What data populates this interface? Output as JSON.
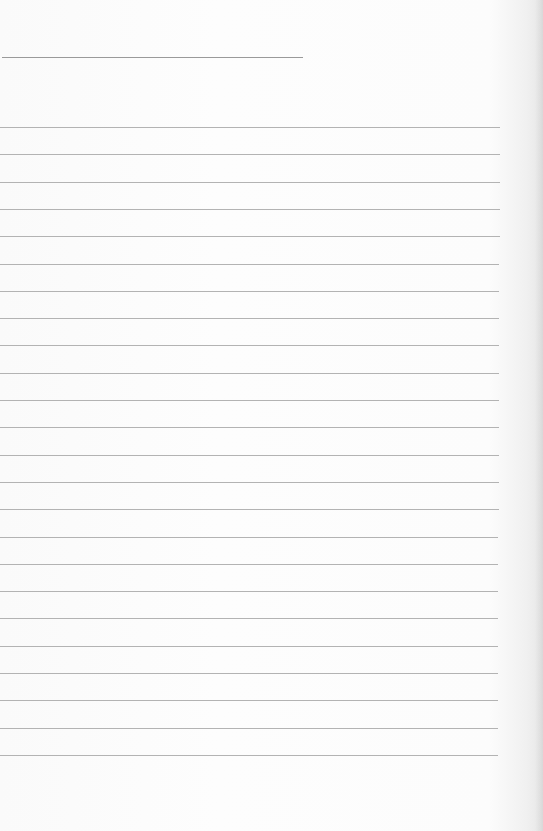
{
  "page": {
    "type": "lined-paper",
    "background_color": "#fbfbfb",
    "line_color": "#a6a6a6",
    "header_line": {
      "x": 2,
      "y": 57,
      "width": 301
    },
    "ruled_lines": {
      "count": 24,
      "first_y": 127,
      "spacing": 27.3,
      "left": 0,
      "width": 500
    }
  }
}
